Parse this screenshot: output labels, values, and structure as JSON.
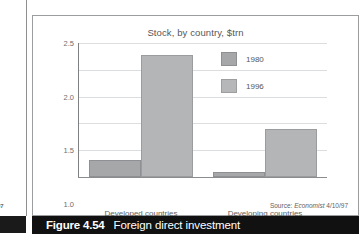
{
  "page": {
    "number": "97"
  },
  "figure": {
    "caption_number": "Figure 4.54",
    "caption_text": "Foreign direct investment",
    "source_prefix": "Source:",
    "source_publication": "Economist",
    "source_date": "4/10/97"
  },
  "colors": {
    "series_1980": "#a6a7a9",
    "series_1996": "#b4b5b7",
    "caption_bar": "#111111",
    "gridline": "#dcdddf",
    "axis": "#8a8c8e"
  },
  "chart_data": {
    "type": "bar",
    "title": "Stock, by country, $trn",
    "xlabel": "",
    "ylabel": "",
    "ylim": [
      0,
      2.5
    ],
    "yticks": [
      "0",
      "0.5",
      "1.0",
      "1.5",
      "2.0",
      "2.5"
    ],
    "ytick_values": [
      0,
      0.5,
      1.0,
      1.5,
      2.0,
      2.5
    ],
    "grid": true,
    "legend_position": "inside-upper-right",
    "categories": [
      "Developed countries",
      "Developing countries"
    ],
    "series": [
      {
        "name": "1980",
        "values": [
          0.32,
          0.1
        ]
      },
      {
        "name": "1996",
        "values": [
          2.27,
          0.89
        ]
      }
    ]
  }
}
